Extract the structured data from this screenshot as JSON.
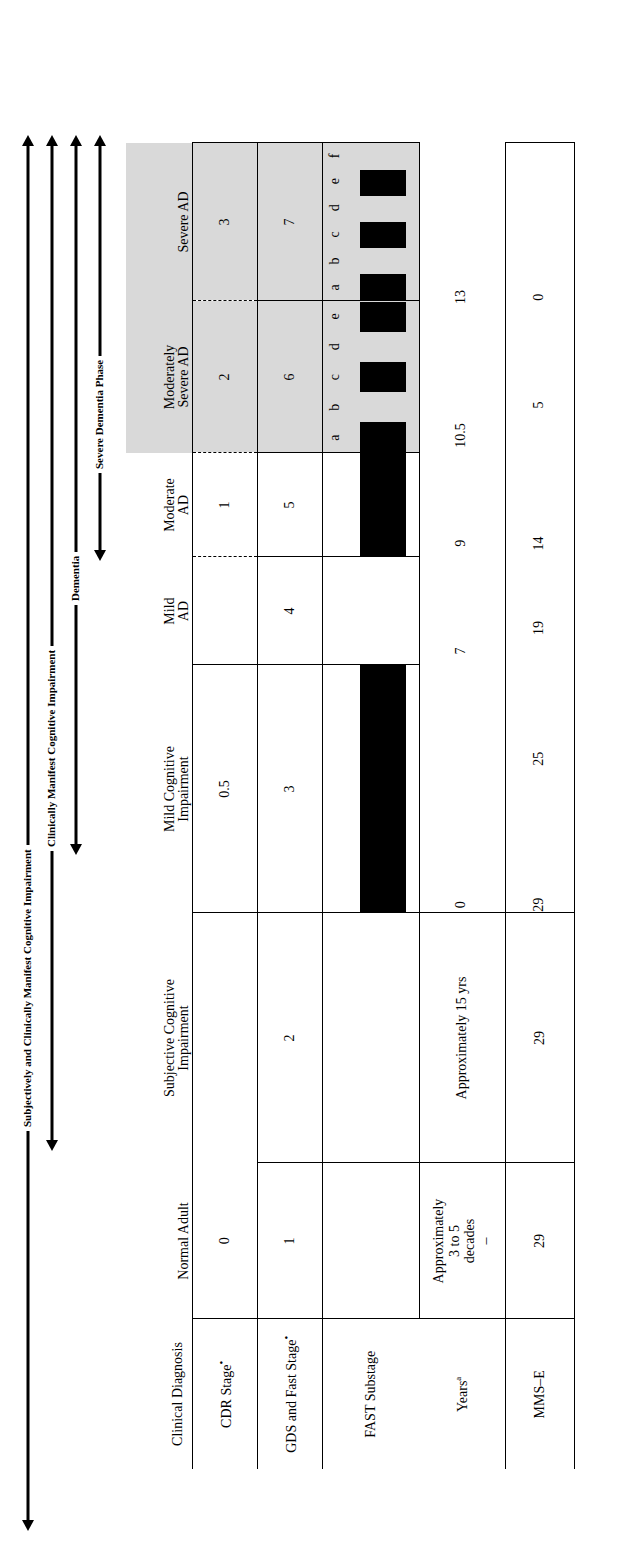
{
  "figure": {
    "type": "clinical-staging-table",
    "orientation": "rotated-90-ccw"
  },
  "arrows": [
    {
      "label": "Subjectively and Clinically Manifest Cognitive Impairment",
      "heads": "both"
    },
    {
      "label": "Clinically Manifest Cognitive Impairment",
      "heads": "both"
    },
    {
      "label": "Dementia",
      "heads": "both"
    },
    {
      "label": "Severe Dementia Phase",
      "heads": "both"
    }
  ],
  "table": {
    "row_labels": {
      "clinical_diagnosis": "Clinical Diagnosis",
      "cdr_stage": "CDR Stage",
      "cdr_stage_mark": "•",
      "gds_fast_stage": "GDS and Fast Stage",
      "gds_fast_stage_mark": "•",
      "fast_substage": "FAST Substage",
      "years": "Years",
      "years_sup": "a",
      "mmse": "MMS–E"
    },
    "columns": [
      {
        "id": "normal",
        "header": "Normal Adult"
      },
      {
        "id": "sci",
        "header": "Subjective Cognitive\nImpairment"
      },
      {
        "id": "mci",
        "header": "Mild Cognitive\nImpairment"
      },
      {
        "id": "mild_ad",
        "header": "Mild\nAD"
      },
      {
        "id": "moderate_ad",
        "header": "Moderate\nAD"
      },
      {
        "id": "mod_severe_ad",
        "header": "Moderately\nSevere AD"
      },
      {
        "id": "severe_ad",
        "header": "Severe AD"
      }
    ],
    "cdr_stage": {
      "normal": "0",
      "sci": "",
      "mci": "0.5",
      "mild_ad": "1",
      "moderate_ad": "1",
      "mod_severe_ad": "2",
      "severe_ad": "3"
    },
    "gds_fast_stage": {
      "normal": "1",
      "sci": "2",
      "mci": "3",
      "mild_ad": "4",
      "moderate_ad": "5",
      "mod_severe_ad": "6",
      "severe_ad": "7"
    },
    "fast_substage": {
      "mod_severe_ad_labels": [
        "a",
        "b",
        "c",
        "d",
        "e"
      ],
      "severe_ad_labels": [
        "a",
        "b",
        "c",
        "d",
        "e",
        "f"
      ]
    },
    "years": {
      "normal": "Approximately\n3 to 5\ndecades",
      "normal_dash": "–",
      "sci": "Approximately 15 yrs",
      "scale_ticks": [
        "0",
        "7",
        "9",
        "10.5",
        "13"
      ]
    },
    "mmse": {
      "normal": "29",
      "sci": "29",
      "scale_ticks": [
        "29",
        "25",
        "19",
        "14",
        "5",
        "0"
      ]
    }
  },
  "colors": {
    "shade": "#d9d9d9",
    "ink": "#000000",
    "paper": "#ffffff"
  }
}
